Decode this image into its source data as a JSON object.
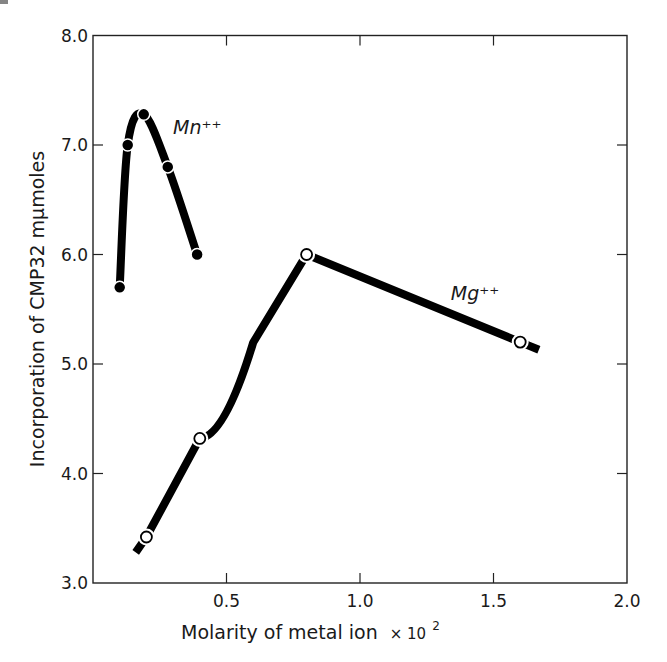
{
  "figure": {
    "corner_mark": "a."
  },
  "chart_data": {
    "type": "line",
    "title": "",
    "xlabel": "Molarity of metal ion × 10²",
    "xlabel_main": "Molarity of metal ion",
    "xlabel_suffix": "× 10",
    "xlabel_sup": "2",
    "ylabel": "Incorporation of CMP32 mμmoles",
    "xlim": [
      0,
      2.0
    ],
    "ylim": [
      3.0,
      8.0
    ],
    "x_ticks": [
      0.5,
      1.0,
      1.5,
      2.0
    ],
    "x_tick_labels": [
      "0.5",
      "1.0",
      "1.5",
      "2.0"
    ],
    "y_ticks": [
      3.0,
      4.0,
      5.0,
      6.0,
      7.0,
      8.0
    ],
    "y_tick_labels": [
      "3.0",
      "4.0",
      "5.0",
      "6.0",
      "7.0",
      "8.0"
    ],
    "grid": false,
    "legend": "none (series labeled inline)",
    "series": [
      {
        "name": "Mn++",
        "label": "Mn⁺⁺",
        "marker": "filled-circle",
        "x": [
          0.1,
          0.13,
          0.19,
          0.28,
          0.39
        ],
        "y": [
          5.7,
          7.0,
          7.28,
          6.8,
          6.0
        ],
        "label_pos": [
          0.3,
          7.1
        ]
      },
      {
        "name": "Mg++",
        "label": "Mg⁺⁺",
        "marker": "open-circle",
        "x": [
          0.2,
          0.4,
          0.8,
          1.6
        ],
        "y": [
          3.42,
          4.32,
          6.0,
          5.2
        ],
        "line_start": [
          0.16,
          3.28
        ],
        "line_end": [
          1.67,
          5.13
        ],
        "label_pos": [
          1.34,
          5.58
        ]
      }
    ]
  }
}
